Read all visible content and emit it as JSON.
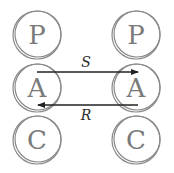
{
  "diagram": {
    "columns": [
      {
        "nodes": [
          "P",
          "A",
          "C"
        ]
      },
      {
        "nodes": [
          "P",
          "A",
          "C"
        ]
      }
    ],
    "edges": [
      {
        "from": "left.A",
        "to": "right.A",
        "label": "S"
      },
      {
        "from": "right.A",
        "to": "left.A",
        "label": "R"
      }
    ],
    "colors": {
      "ring": "#8a8a8a",
      "letter": "#7a7a7a",
      "arrow": "#222222"
    }
  }
}
